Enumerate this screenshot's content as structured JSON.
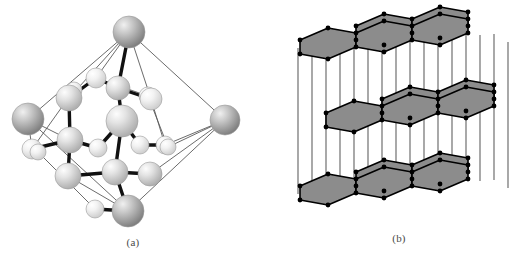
{
  "figure": {
    "background_color": "#ffffff",
    "width": 532,
    "height": 262
  },
  "panels": [
    {
      "id": "a",
      "caption": "(a)",
      "subject": "diamond-cubic-unit-cell",
      "description": "Diamond cubic lattice unit cell drawn as shaded spheres joined by bonds, cube outline rotated about 45 degrees",
      "colors": {
        "sphere_light": "#e8e8e8",
        "sphere_mid": "#c9c9c9",
        "sphere_dark": "#8f8f8f",
        "sphere_outline": "#9a9a9a",
        "bond_strong": "#111111",
        "cell_edge": "#555555"
      },
      "atom_count": 22,
      "corner_atoms": 6,
      "spheres": [
        {
          "name": "corner-top",
          "cx": 129,
          "cy": 32,
          "r": 16,
          "shade": "dark"
        },
        {
          "name": "corner-left",
          "cx": 28,
          "cy": 119,
          "r": 16,
          "shade": "dark"
        },
        {
          "name": "corner-right",
          "cx": 225,
          "cy": 120,
          "r": 15,
          "shade": "dark"
        },
        {
          "name": "corner-bottom",
          "cx": 128,
          "cy": 211,
          "r": 16,
          "shade": "dark"
        },
        {
          "name": "cell-top-back",
          "cx": 96,
          "cy": 78,
          "r": 10,
          "shade": "light"
        },
        {
          "name": "cell-top-right",
          "cx": 118,
          "cy": 88,
          "r": 12,
          "shade": "mid"
        },
        {
          "name": "cell-top-left",
          "cx": 69,
          "cy": 98,
          "r": 13,
          "shade": "mid"
        },
        {
          "name": "cell-top-front",
          "cx": 151,
          "cy": 99,
          "r": 11,
          "shade": "light"
        },
        {
          "name": "center-large",
          "cx": 122,
          "cy": 121,
          "r": 16,
          "shade": "mid"
        },
        {
          "name": "mid-left",
          "cx": 70,
          "cy": 140,
          "r": 13,
          "shade": "mid"
        },
        {
          "name": "mid-left-small",
          "cx": 98,
          "cy": 148,
          "r": 9,
          "shade": "light"
        },
        {
          "name": "mid-right-small",
          "cx": 140,
          "cy": 145,
          "r": 9,
          "shade": "light"
        },
        {
          "name": "mid-right",
          "cx": 165,
          "cy": 145,
          "r": 9,
          "shade": "light"
        },
        {
          "name": "mid-far-left",
          "cx": 32,
          "cy": 149,
          "r": 10,
          "shade": "light"
        },
        {
          "name": "low-left",
          "cx": 68,
          "cy": 176,
          "r": 13,
          "shade": "mid"
        },
        {
          "name": "low-center",
          "cx": 115,
          "cy": 172,
          "r": 13,
          "shade": "mid"
        },
        {
          "name": "low-right",
          "cx": 150,
          "cy": 174,
          "r": 12,
          "shade": "mid"
        },
        {
          "name": "low-front-small",
          "cx": 95,
          "cy": 209,
          "r": 9,
          "shade": "light"
        },
        {
          "name": "back-upper-left",
          "cx": 74,
          "cy": 90,
          "r": 8,
          "shade": "light"
        },
        {
          "name": "back-upper-right",
          "cx": 148,
          "cy": 96,
          "r": 9,
          "shade": "light"
        },
        {
          "name": "edge-left-small",
          "cx": 38,
          "cy": 152,
          "r": 8,
          "shade": "light"
        },
        {
          "name": "edge-right-small",
          "cx": 168,
          "cy": 147,
          "r": 8,
          "shade": "light"
        }
      ]
    },
    {
      "id": "b",
      "caption": "(b)",
      "subject": "graphite-layered-structure",
      "description": "Graphite shown as three stacked sheets of fused shaded hexagons connected by thin vertical pillars; middle sheet offset (ABAB stacking)",
      "colors": {
        "hexagon_fill": "#8c8c8c",
        "hexagon_edge": "#000000",
        "vertex_dot": "#000000",
        "pillar": "#6f6f6f"
      },
      "layer_count": 3,
      "hexagons_per_layer": 5,
      "layers": [
        {
          "name": "top-layer",
          "y": 40,
          "offset_x": 0,
          "rows": [
            2,
            3
          ]
        },
        {
          "name": "middle-layer",
          "y": 113,
          "offset_x": 26,
          "rows": [
            2,
            3
          ]
        },
        {
          "name": "bottom-layer",
          "y": 186,
          "offset_x": 0,
          "rows": [
            2,
            3
          ]
        }
      ]
    }
  ]
}
